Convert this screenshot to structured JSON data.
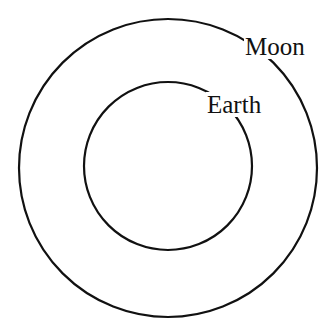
{
  "diagram": {
    "type": "concentric-orbits",
    "orbits": [
      {
        "name": "outer",
        "label": "Moon",
        "cx": 168,
        "cy": 168,
        "r": 149
      },
      {
        "name": "inner",
        "label": "Earth",
        "cx": 168,
        "cy": 166,
        "r": 84
      }
    ],
    "stroke_color": "#111111",
    "background": "#ffffff"
  }
}
